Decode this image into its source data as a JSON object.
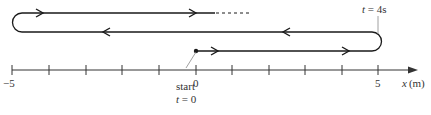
{
  "diagram": {
    "type": "motion-path-on-number-line",
    "colors": {
      "path": "#1a1a1a",
      "axis": "#333333",
      "leader": "#888888",
      "text": "#333333"
    },
    "axis": {
      "label_var": "x",
      "label_unit": "(m)",
      "min": -5,
      "max": 5,
      "tick_step": 1,
      "tick_labels": [
        {
          "value": -5,
          "text": "−5"
        },
        {
          "value": 0,
          "text": "0"
        },
        {
          "value": 5,
          "text": "5"
        }
      ]
    },
    "annotations": {
      "start_label": "start",
      "start_time": "t = 0",
      "turn_time": "t = 4s"
    },
    "path_segments": [
      {
        "from": 0,
        "to": 5,
        "direction": "right",
        "level": "bottom"
      },
      {
        "from": 5,
        "to": -5,
        "direction": "left",
        "level": "middle"
      },
      {
        "from": -5,
        "to": 0.5,
        "direction": "right",
        "level": "top",
        "continues": "dashed"
      }
    ]
  }
}
